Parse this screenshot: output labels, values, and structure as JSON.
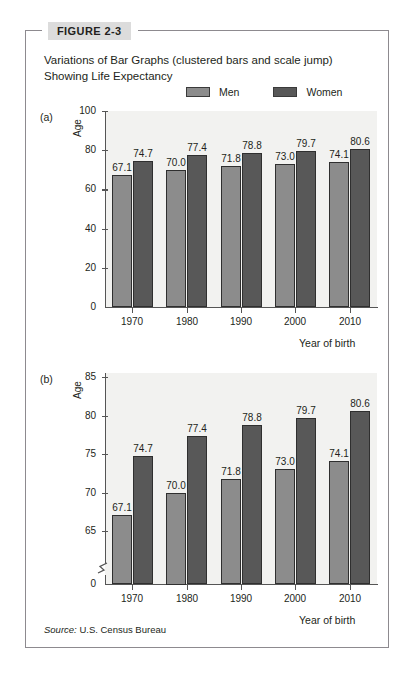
{
  "figure": {
    "tag": "FIGURE 2-3",
    "title": "Variations of Bar Graphs (clustered bars and scale jump) Showing Life Expectancy",
    "source_lead": "Source:",
    "source_text": "U.S. Census Bureau"
  },
  "legend": {
    "items": [
      {
        "label": "Men",
        "color": "#8c8c8c"
      },
      {
        "label": "Women",
        "color": "#585858"
      }
    ]
  },
  "panels": {
    "a": {
      "letter": "(a)"
    },
    "b": {
      "letter": "(b)"
    }
  },
  "chart_data": [
    {
      "type": "bar",
      "panel": "(a)",
      "title": "",
      "xlabel": "Year of birth",
      "ylabel": "Age",
      "categories": [
        "1970",
        "1980",
        "1990",
        "2000",
        "2010"
      ],
      "yticks": [
        "0",
        "20",
        "40",
        "60",
        "80",
        "100"
      ],
      "ylim": [
        0,
        100
      ],
      "grid": false,
      "scale_break": false,
      "legend_position": "top-right",
      "series": [
        {
          "name": "Men",
          "color": "#8c8c8c",
          "values": [
            67.1,
            70.0,
            71.8,
            73.0,
            74.1
          ],
          "labels": [
            "67.1",
            "70.0",
            "71.8",
            "73.0",
            "74.1"
          ]
        },
        {
          "name": "Women",
          "color": "#585858",
          "values": [
            74.7,
            77.4,
            78.8,
            79.7,
            80.6
          ],
          "labels": [
            "74.7",
            "77.4",
            "78.8",
            "79.7",
            "80.6"
          ]
        }
      ]
    },
    {
      "type": "bar",
      "panel": "(b)",
      "title": "",
      "xlabel": "Year of birth",
      "ylabel": "Age",
      "categories": [
        "1970",
        "1980",
        "1990",
        "2000",
        "2010"
      ],
      "yticks": [
        "0",
        "65",
        "70",
        "75",
        "80",
        "85"
      ],
      "ylim": [
        65,
        85
      ],
      "grid": false,
      "scale_break": true,
      "legend_position": "shared",
      "series": [
        {
          "name": "Men",
          "color": "#8c8c8c",
          "values": [
            67.1,
            70.0,
            71.8,
            73.0,
            74.1
          ],
          "labels": [
            "67.1",
            "70.0",
            "71.8",
            "73.0",
            "74.1"
          ]
        },
        {
          "name": "Women",
          "color": "#585858",
          "values": [
            74.7,
            77.4,
            78.8,
            79.7,
            80.6
          ],
          "labels": [
            "74.7",
            "77.4",
            "78.8",
            "79.7",
            "80.6"
          ]
        }
      ]
    }
  ]
}
